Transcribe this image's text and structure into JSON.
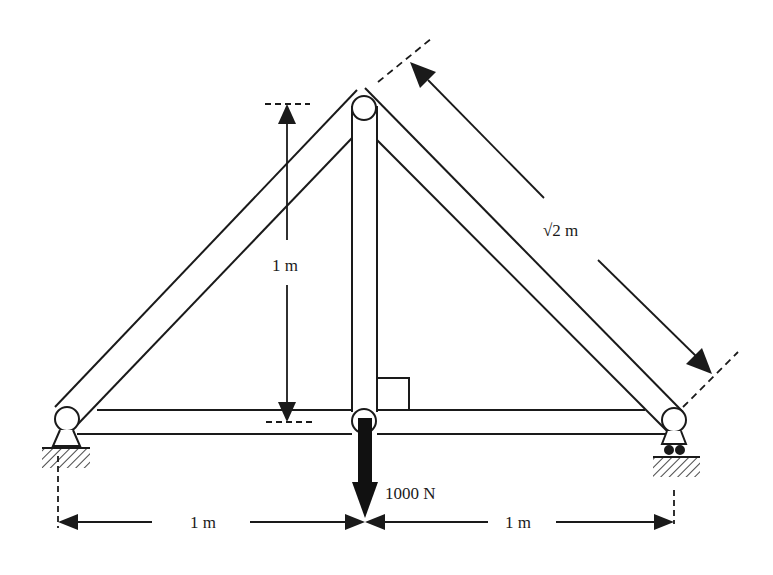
{
  "diagram": {
    "type": "truss",
    "colors": {
      "stroke": "#1a1a1a",
      "background": "#ffffff",
      "load_fill": "#111111"
    },
    "members": [
      {
        "name": "left-rafter",
        "from": "left-support-joint",
        "to": "apex-joint"
      },
      {
        "name": "right-rafter",
        "from": "apex-joint",
        "to": "right-support-joint"
      },
      {
        "name": "vertical-member",
        "from": "apex-joint",
        "to": "bottom-center-joint"
      },
      {
        "name": "bottom-chord",
        "from": "left-support-joint",
        "to": "right-support-joint"
      }
    ],
    "supports": [
      {
        "name": "pin-support",
        "location": "left"
      },
      {
        "name": "roller-support",
        "location": "right"
      }
    ],
    "labels": {
      "height_dim": "1 m",
      "rafter_dim": "√2 m",
      "load": "1000 N",
      "left_span": "1 m",
      "right_span": "1 m"
    }
  }
}
